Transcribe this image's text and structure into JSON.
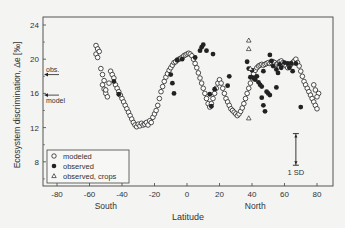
{
  "chart_data": {
    "type": "scatter",
    "title": "",
    "xlabel": "Latitude",
    "ylabel": "Ecosystem discrimination, Δe [‰]",
    "xlim": [
      -92,
      90
    ],
    "ylim": [
      5.2,
      25
    ],
    "x_ticks": [
      -80,
      -60,
      -40,
      -20,
      0,
      20,
      40,
      60,
      80
    ],
    "y_ticks": [
      8,
      12,
      16,
      20,
      24
    ],
    "grid": false,
    "legend_position": "lower left",
    "hemisphere_labels": [
      {
        "text": "South",
        "x": -50
      },
      {
        "text": "North",
        "x": 42
      }
    ],
    "annotations": [
      {
        "text": "obs.",
        "type": "arrow",
        "y": 18.2
      },
      {
        "text": "model",
        "type": "arrow",
        "y": 15.8
      },
      {
        "text": "1 SD",
        "type": "errorbar",
        "x": 67,
        "y_low": 7.6,
        "y_high": 11.3
      }
    ],
    "series": [
      {
        "name": "modeled",
        "marker": "open-circle",
        "points": [
          [
            -56,
            21.6
          ],
          [
            -55,
            21.2
          ],
          [
            -56,
            20.6
          ],
          [
            -55,
            20.2
          ],
          [
            -54,
            20.9
          ],
          [
            -53,
            18.9
          ],
          [
            -52,
            18.2
          ],
          [
            -51,
            17.5
          ],
          [
            -52,
            17.0
          ],
          [
            -51,
            16.5
          ],
          [
            -50,
            16.0
          ],
          [
            -49,
            15.6
          ],
          [
            -50,
            16.4
          ],
          [
            -48,
            17.2
          ],
          [
            -47,
            18.6
          ],
          [
            -46,
            18.2
          ],
          [
            -45,
            17.8
          ],
          [
            -44,
            17.0
          ],
          [
            -43,
            16.6
          ],
          [
            -42,
            16.2
          ],
          [
            -41,
            15.8
          ],
          [
            -40,
            15.4
          ],
          [
            -39,
            15.0
          ],
          [
            -38,
            14.6
          ],
          [
            -37,
            14.2
          ],
          [
            -36,
            13.8
          ],
          [
            -35,
            13.4
          ],
          [
            -34,
            13.0
          ],
          [
            -33,
            12.6
          ],
          [
            -32,
            12.3
          ],
          [
            -31,
            12.1
          ],
          [
            -30,
            12.4
          ],
          [
            -29,
            12.2
          ],
          [
            -28,
            12.5
          ],
          [
            -27,
            12.3
          ],
          [
            -26,
            12.4
          ],
          [
            -25,
            12.6
          ],
          [
            -24,
            12.3
          ],
          [
            -23,
            12.8
          ],
          [
            -22,
            12.6
          ],
          [
            -21,
            13.2
          ],
          [
            -20,
            13.6
          ],
          [
            -19,
            14.0
          ],
          [
            -18,
            14.6
          ],
          [
            -17,
            15.4
          ],
          [
            -16,
            16.2
          ],
          [
            -15,
            16.8
          ],
          [
            -14,
            17.4
          ],
          [
            -13,
            17.9
          ],
          [
            -12,
            18.3
          ],
          [
            -11,
            18.7
          ],
          [
            -10,
            19.0
          ],
          [
            -9,
            19.3
          ],
          [
            -8,
            19.6
          ],
          [
            -7,
            19.7
          ],
          [
            -6,
            19.9
          ],
          [
            -5,
            20.0
          ],
          [
            -4,
            20.1
          ],
          [
            -3,
            20.2
          ],
          [
            -2,
            20.4
          ],
          [
            -1,
            20.5
          ],
          [
            0,
            20.6
          ],
          [
            1,
            20.7
          ],
          [
            2,
            20.6
          ],
          [
            3,
            20.4
          ],
          [
            4,
            20.0
          ],
          [
            5,
            19.5
          ],
          [
            6,
            19.0
          ],
          [
            7,
            18.4
          ],
          [
            8,
            17.8
          ],
          [
            9,
            17.2
          ],
          [
            10,
            16.6
          ],
          [
            11,
            16.0
          ],
          [
            12,
            15.4
          ],
          [
            13,
            14.8
          ],
          [
            14,
            14.4
          ],
          [
            15,
            14.8
          ],
          [
            16,
            15.4
          ],
          [
            17,
            16.0
          ],
          [
            18,
            16.6
          ],
          [
            19,
            17.2
          ],
          [
            20,
            17.6
          ],
          [
            21,
            17.2
          ],
          [
            22,
            16.6
          ],
          [
            23,
            16.0
          ],
          [
            24,
            15.4
          ],
          [
            25,
            15.0
          ],
          [
            26,
            14.6
          ],
          [
            27,
            14.2
          ],
          [
            28,
            14.0
          ],
          [
            29,
            13.8
          ],
          [
            30,
            13.6
          ],
          [
            31,
            13.4
          ],
          [
            32,
            13.6
          ],
          [
            33,
            13.9
          ],
          [
            34,
            14.3
          ],
          [
            35,
            14.8
          ],
          [
            36,
            15.4
          ],
          [
            37,
            16.0
          ],
          [
            38,
            16.6
          ],
          [
            39,
            17.2
          ],
          [
            40,
            17.8
          ],
          [
            41,
            18.3
          ],
          [
            42,
            18.7
          ],
          [
            43,
            19.0
          ],
          [
            44,
            19.2
          ],
          [
            45,
            19.3
          ],
          [
            46,
            19.4
          ],
          [
            47,
            19.3
          ],
          [
            48,
            19.4
          ],
          [
            49,
            19.5
          ],
          [
            50,
            19.6
          ],
          [
            51,
            19.5
          ],
          [
            52,
            19.6
          ],
          [
            53,
            19.7
          ],
          [
            54,
            19.6
          ],
          [
            55,
            19.4
          ],
          [
            56,
            19.5
          ],
          [
            57,
            19.7
          ],
          [
            58,
            19.8
          ],
          [
            59,
            19.6
          ],
          [
            60,
            19.4
          ],
          [
            61,
            19.2
          ],
          [
            62,
            19.0
          ],
          [
            63,
            19.2
          ],
          [
            64,
            19.4
          ],
          [
            65,
            19.6
          ],
          [
            66,
            19.8
          ],
          [
            67,
            20.0
          ],
          [
            68,
            19.6
          ],
          [
            69,
            19.2
          ],
          [
            70,
            18.6
          ],
          [
            71,
            18.0
          ],
          [
            72,
            17.4
          ],
          [
            73,
            17.0
          ],
          [
            74,
            16.6
          ],
          [
            75,
            16.2
          ],
          [
            76,
            15.8
          ],
          [
            77,
            15.4
          ],
          [
            78,
            15.0
          ],
          [
            79,
            14.6
          ],
          [
            80,
            14.2
          ],
          [
            81,
            16.0
          ],
          [
            80,
            15.6
          ],
          [
            79,
            16.4
          ],
          [
            78,
            17.0
          ]
        ]
      },
      {
        "name": "observed",
        "marker": "filled-circle",
        "points": [
          [
            -45,
            17.4
          ],
          [
            -42,
            15.9
          ],
          [
            -10,
            18.2
          ],
          [
            -9,
            17.2
          ],
          [
            -8,
            16.0
          ],
          [
            -6,
            19.9
          ],
          [
            -3,
            20.0
          ],
          [
            5,
            20.2
          ],
          [
            8,
            21.0
          ],
          [
            9,
            21.4
          ],
          [
            10,
            21.7
          ],
          [
            12,
            21.0
          ],
          [
            16,
            20.6
          ],
          [
            14,
            15.9
          ],
          [
            15,
            14.5
          ],
          [
            17,
            16.5
          ],
          [
            25,
            16.9
          ],
          [
            26,
            18.0
          ],
          [
            37,
            19.7
          ],
          [
            38,
            18.9
          ],
          [
            39,
            17.9
          ],
          [
            40,
            18.7
          ],
          [
            41,
            17.8
          ],
          [
            42,
            17.6
          ],
          [
            43,
            18.0
          ],
          [
            44,
            17.3
          ],
          [
            45,
            17.0
          ],
          [
            46,
            16.8
          ],
          [
            46,
            15.5
          ],
          [
            47,
            14.6
          ],
          [
            48,
            13.9
          ],
          [
            49,
            16.2
          ],
          [
            50,
            16.0
          ],
          [
            51,
            15.8
          ],
          [
            51,
            20.5
          ],
          [
            52,
            19.8
          ],
          [
            53,
            19.2
          ],
          [
            55,
            18.8
          ],
          [
            56,
            18.4
          ],
          [
            57,
            19.4
          ],
          [
            58,
            19.0
          ],
          [
            60,
            19.6
          ],
          [
            62,
            19.5
          ],
          [
            63,
            19.0
          ],
          [
            64,
            19.5
          ],
          [
            65,
            18.6
          ],
          [
            67,
            19.5
          ],
          [
            70,
            14.4
          ],
          [
            55,
            16.7
          ],
          [
            47,
            18.6
          ]
        ]
      },
      {
        "name": "observed, crops",
        "marker": "open-triangle",
        "points": [
          [
            38,
            22.2
          ],
          [
            38,
            21.2
          ],
          [
            39,
            18.9
          ],
          [
            38,
            13.1
          ]
        ]
      }
    ]
  }
}
